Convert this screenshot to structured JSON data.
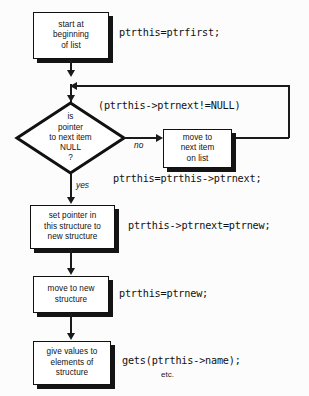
{
  "diagram": {
    "type": "flowchart",
    "colors": {
      "background": "#fcfcfc",
      "stroke": "#111111",
      "shadow": "#141414",
      "box_fill": "#ffffff"
    },
    "nodes": [
      {
        "id": "start",
        "shape": "process",
        "lines": [
          "start at",
          "beginning",
          "of list"
        ]
      },
      {
        "id": "decision",
        "shape": "decision",
        "lines": [
          "is",
          "pointer",
          "to next item",
          "NULL",
          "?"
        ]
      },
      {
        "id": "move-next",
        "shape": "process",
        "lines": [
          "move to",
          "next item",
          "on list"
        ]
      },
      {
        "id": "set-pointer",
        "shape": "process",
        "lines": [
          "set pointer in",
          "this structure to",
          "new structure"
        ]
      },
      {
        "id": "move-new",
        "shape": "process",
        "lines": [
          "move to new",
          "structure"
        ]
      },
      {
        "id": "give-values",
        "shape": "process",
        "lines": [
          "give values to",
          "elements of",
          "structure"
        ]
      }
    ],
    "branch_labels": {
      "no": "no",
      "yes": "yes"
    },
    "code_annotations": [
      {
        "id": "code-start",
        "text": "ptrthis=ptrfirst;"
      },
      {
        "id": "code-condition",
        "text": "(ptrthis->ptrnext!=NULL)"
      },
      {
        "id": "code-move-next",
        "text": "ptrthis=ptrthis->ptrnext;"
      },
      {
        "id": "code-set-pointer",
        "text": "ptrthis->ptrnext=ptrnew;"
      },
      {
        "id": "code-move-new",
        "text": "ptrthis=ptrnew;"
      },
      {
        "id": "code-give-values",
        "text": "gets(ptrthis->name);"
      },
      {
        "id": "code-etc",
        "text": "etc."
      }
    ]
  }
}
